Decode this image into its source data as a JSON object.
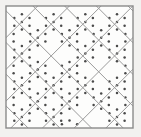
{
  "figure": {
    "description": "Square frame enclosing a 45-degree diagonal grid forming a lattice of diamonds; alternating diamonds are filled with a dot stipple texture while the remainder are left blank.",
    "width": 141,
    "height": 137
  },
  "canvas": {
    "page_background": "#f2f1ef",
    "plate_background": "#fbfbfa"
  },
  "frame": {
    "name": "outer-border",
    "x": 6,
    "y": 6,
    "width": 127,
    "height": 122,
    "stroke": "#8a8a8a",
    "stroke_width": 1.4,
    "fill": "#fdfdfc"
  },
  "lattice": {
    "stroke": "#9a9a9a",
    "stroke_width": 1.0,
    "cell_pitch": 31.7,
    "angle_degrees": 45,
    "origin_x": 6,
    "origin_y": 6,
    "columns": 4,
    "rows": 4
  },
  "dots": {
    "color": "#4a4a4a",
    "radius": 1.25,
    "spacing": 7.6,
    "rows_per_diamond": 4
  },
  "diamonds": [
    {
      "cx": 21.9,
      "cy": 21.9,
      "filled": true
    },
    {
      "cx": 53.6,
      "cy": 21.9,
      "filled": true
    },
    {
      "cx": 85.3,
      "cy": 21.9,
      "filled": true
    },
    {
      "cx": 117.0,
      "cy": 21.9,
      "filled": true
    },
    {
      "cx": 37.8,
      "cy": 37.8,
      "filled": true
    },
    {
      "cx": 69.5,
      "cy": 37.8,
      "filled": true
    },
    {
      "cx": 101.2,
      "cy": 37.8,
      "filled": true
    },
    {
      "cx": 21.9,
      "cy": 53.6,
      "filled": true
    },
    {
      "cx": 53.6,
      "cy": 53.6,
      "filled": false
    },
    {
      "cx": 85.3,
      "cy": 53.6,
      "filled": true
    },
    {
      "cx": 117.0,
      "cy": 53.6,
      "filled": true
    },
    {
      "cx": 37.8,
      "cy": 69.5,
      "filled": true
    },
    {
      "cx": 69.5,
      "cy": 69.5,
      "filled": true
    },
    {
      "cx": 101.2,
      "cy": 69.5,
      "filled": false
    },
    {
      "cx": 21.9,
      "cy": 85.3,
      "filled": true
    },
    {
      "cx": 53.6,
      "cy": 85.3,
      "filled": true
    },
    {
      "cx": 85.3,
      "cy": 85.3,
      "filled": true
    },
    {
      "cx": 117.0,
      "cy": 85.3,
      "filled": true
    },
    {
      "cx": 37.8,
      "cy": 101.2,
      "filled": true
    },
    {
      "cx": 69.5,
      "cy": 101.2,
      "filled": true
    },
    {
      "cx": 101.2,
      "cy": 101.2,
      "filled": true
    },
    {
      "cx": 21.9,
      "cy": 117.0,
      "filled": true
    },
    {
      "cx": 53.6,
      "cy": 117.0,
      "filled": true
    },
    {
      "cx": 85.3,
      "cy": 117.0,
      "filled": false
    },
    {
      "cx": 117.0,
      "cy": 117.0,
      "filled": true
    }
  ],
  "edge_half_diamonds": [
    {
      "cx": 6.0,
      "cy": 37.8,
      "filled": true
    },
    {
      "cx": 6.0,
      "cy": 69.5,
      "filled": true
    },
    {
      "cx": 6.0,
      "cy": 101.2,
      "filled": true
    },
    {
      "cx": 133.0,
      "cy": 37.8,
      "filled": true
    },
    {
      "cx": 133.0,
      "cy": 69.5,
      "filled": true
    },
    {
      "cx": 133.0,
      "cy": 101.2,
      "filled": true
    },
    {
      "cx": 37.8,
      "cy": 6.0,
      "filled": false
    },
    {
      "cx": 69.5,
      "cy": 6.0,
      "filled": false
    },
    {
      "cx": 101.2,
      "cy": 6.0,
      "filled": false
    },
    {
      "cx": 37.8,
      "cy": 128.0,
      "filled": false
    },
    {
      "cx": 69.5,
      "cy": 128.0,
      "filled": true
    },
    {
      "cx": 101.2,
      "cy": 128.0,
      "filled": false
    }
  ]
}
